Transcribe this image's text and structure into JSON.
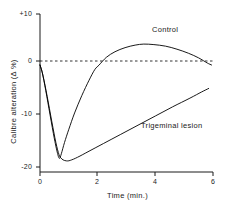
{
  "chart_data": {
    "type": "line",
    "title": "",
    "subtitle": "",
    "xlabel": "Time (min.)",
    "ylabel": "Calibre alteration (Δ %)",
    "xlim": [
      0,
      6
    ],
    "ylim": [
      -20,
      10
    ],
    "xticks": [
      0,
      2,
      4,
      6
    ],
    "xtick_labels": [
      "0",
      "2",
      "4",
      "6"
    ],
    "yticks": [
      10,
      0,
      -10,
      -20
    ],
    "ytick_labels": [
      "+10",
      "0",
      "-10",
      "-20"
    ],
    "grid": false,
    "legend_position": "inline-annotation",
    "zero_reference_line": {
      "value": 0,
      "style": "dashed",
      "color": "#000000"
    },
    "series": [
      {
        "name": "Control",
        "label": "Control",
        "color": "#000000",
        "style": "solid",
        "points": [
          [
            0.0,
            0.0
          ],
          [
            0.08,
            -1.5
          ],
          [
            0.2,
            -5.0
          ],
          [
            0.35,
            -9.8
          ],
          [
            0.5,
            -14.5
          ],
          [
            0.62,
            -17.6
          ],
          [
            0.68,
            -18.3
          ],
          [
            0.74,
            -17.4
          ],
          [
            0.85,
            -15.2
          ],
          [
            1.0,
            -12.6
          ],
          [
            1.2,
            -9.4
          ],
          [
            1.45,
            -6.0
          ],
          [
            1.7,
            -3.0
          ],
          [
            1.9,
            -0.9
          ],
          [
            2.05,
            0.0
          ],
          [
            2.3,
            1.5
          ],
          [
            2.6,
            2.6
          ],
          [
            2.95,
            3.4
          ],
          [
            3.3,
            3.9
          ],
          [
            3.6,
            4.1
          ],
          [
            3.95,
            4.0
          ],
          [
            4.35,
            3.7
          ],
          [
            4.75,
            3.1
          ],
          [
            5.15,
            2.3
          ],
          [
            5.5,
            1.4
          ],
          [
            5.8,
            0.4
          ],
          [
            5.95,
            0.0
          ]
        ]
      },
      {
        "name": "Trigeminal lesion",
        "label": "Trigeminal lesion",
        "color": "#000000",
        "style": "solid",
        "points": [
          [
            0.0,
            0.0
          ],
          [
            0.1,
            -2.0
          ],
          [
            0.25,
            -6.2
          ],
          [
            0.4,
            -10.8
          ],
          [
            0.55,
            -15.2
          ],
          [
            0.66,
            -17.6
          ],
          [
            0.72,
            -18.2
          ],
          [
            0.8,
            -18.6
          ],
          [
            0.92,
            -18.8
          ],
          [
            1.05,
            -18.7
          ],
          [
            1.3,
            -18.1
          ],
          [
            1.7,
            -16.9
          ],
          [
            2.2,
            -15.4
          ],
          [
            2.8,
            -13.6
          ],
          [
            3.4,
            -11.8
          ],
          [
            4.0,
            -10.0
          ],
          [
            4.6,
            -8.2
          ],
          [
            5.2,
            -6.5
          ],
          [
            5.6,
            -5.3
          ],
          [
            5.85,
            -4.6
          ]
        ]
      }
    ]
  },
  "axes": {
    "y_title": "Calibre alteration (Δ %)",
    "x_title": "Time (min.)",
    "y_labels": [
      "+10",
      "0",
      "-10",
      "-20"
    ],
    "x_labels": [
      "0",
      "2",
      "4",
      "6"
    ]
  },
  "annotations": {
    "control": "Control",
    "trigeminal": "Trigeminal lesion"
  }
}
